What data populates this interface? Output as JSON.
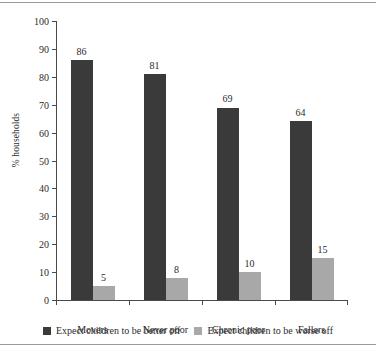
{
  "chart_data": {
    "type": "bar",
    "title": "",
    "xlabel": "",
    "ylabel": "% households",
    "ylim": [
      0,
      100
    ],
    "yticks": [
      0,
      10,
      20,
      30,
      40,
      50,
      60,
      70,
      80,
      90,
      100
    ],
    "grid": false,
    "legend_position": "bottom",
    "categories": [
      "Movers",
      "Never poor",
      "Chronic poor",
      "Fallers"
    ],
    "series": [
      {
        "name": "Expect children to be better off",
        "color": "#3a3a3a",
        "values": [
          86,
          81,
          69,
          64
        ]
      },
      {
        "name": "Expect children to be worse off",
        "color": "#a8a8a8",
        "values": [
          5,
          8,
          10,
          15
        ]
      }
    ]
  }
}
